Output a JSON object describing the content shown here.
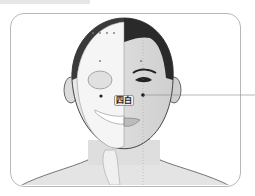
{
  "figure": {
    "type": "acupuncture-point-illustration",
    "point_label": "四白",
    "colors": {
      "frame_border": "#b8b8b8",
      "hair": "#2a2a2a",
      "skin": "#dcdcdc",
      "skull": "#f4f4f4",
      "point": "#111111",
      "leader_line": "#888888"
    }
  }
}
